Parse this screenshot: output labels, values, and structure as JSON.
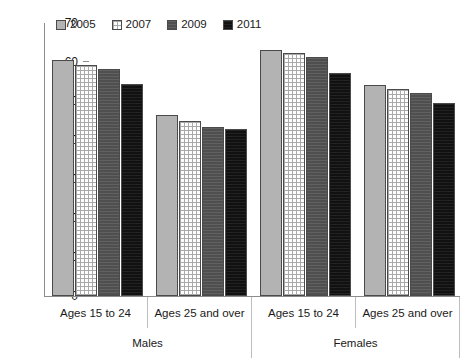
{
  "chart_data": {
    "type": "bar",
    "title": "",
    "xlabel": "",
    "ylabel": "",
    "ylim": [
      0,
      70
    ],
    "yticks": [
      0,
      10,
      20,
      30,
      40,
      50,
      60,
      70
    ],
    "grid": false,
    "legend_position": "top-left",
    "legend": [
      "2005",
      "2007",
      "2009",
      "2011"
    ],
    "group_headers": [
      "Males",
      "Females"
    ],
    "categories": [
      "Ages 15 to 24",
      "Ages 25 and over",
      "Ages 15 to 24",
      "Ages 25 and over"
    ],
    "series": [
      {
        "name": "2005",
        "values": [
          60.5,
          46.5,
          63.0,
          54.0
        ],
        "color": "#b3b3b3"
      },
      {
        "name": "2007",
        "values": [
          59.3,
          45.0,
          62.3,
          53.2
        ],
        "color": "#ffffff"
      },
      {
        "name": "2009",
        "values": [
          58.2,
          43.3,
          61.2,
          52.1
        ],
        "color": "#4f4f4f"
      },
      {
        "name": "2011",
        "values": [
          54.4,
          42.8,
          57.2,
          49.4
        ],
        "color": "#111111"
      }
    ]
  },
  "axis": {
    "tick_labels": [
      "70",
      "60",
      "50",
      "40",
      "30",
      "20",
      "10",
      "0"
    ]
  }
}
